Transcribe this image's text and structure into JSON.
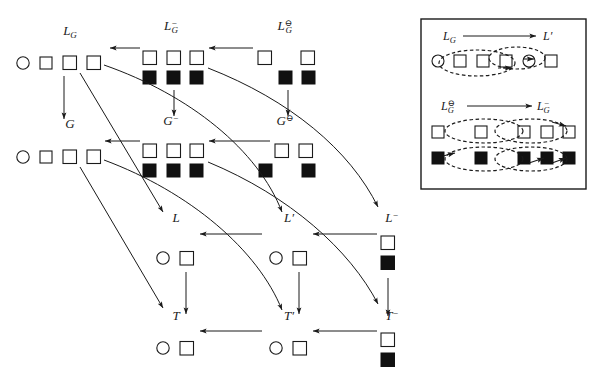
{
  "figure": {
    "type": "commutative-diagram",
    "colors": {
      "stroke": "#1a1a1a",
      "fill_open": "#ffffff",
      "fill_solid": "#111111",
      "background": "#ffffff"
    }
  },
  "main_diagram": {
    "objects": [
      {
        "id": "LG",
        "label": "L_G",
        "label_tex": "L_G",
        "glyphs_top": [
          "circle",
          "square",
          "square",
          "square"
        ],
        "glyphs_bottom": []
      },
      {
        "id": "LGminus",
        "label": "L_G^-",
        "label_tex": "L_G^{-}",
        "glyphs_top": [
          "square",
          "square",
          "square"
        ],
        "glyphs_bottom": [
          "solid",
          "solid",
          "solid"
        ]
      },
      {
        "id": "LGominus",
        "label": "L_G^⊖",
        "label_tex": "L_G^{\\ominus}",
        "glyphs_top": [
          "square",
          "square"
        ],
        "glyphs_bottom": [
          "solid",
          "solid"
        ]
      },
      {
        "id": "G",
        "label": "G",
        "label_tex": "G",
        "glyphs_top": [
          "circle",
          "square",
          "square",
          "square"
        ],
        "glyphs_bottom": []
      },
      {
        "id": "Gminus",
        "label": "G^-",
        "label_tex": "G^{-}",
        "glyphs_top": [
          "square",
          "square",
          "square"
        ],
        "glyphs_bottom": [
          "solid",
          "solid",
          "solid"
        ]
      },
      {
        "id": "Gominus",
        "label": "G^⊖",
        "label_tex": "G^{\\ominus}",
        "glyphs_top": [
          "square",
          "square"
        ],
        "glyphs_bottom": [
          "solid",
          "solid"
        ]
      },
      {
        "id": "L",
        "label": "L",
        "label_tex": "L",
        "glyphs_top": [
          "circle",
          "square"
        ],
        "glyphs_bottom": []
      },
      {
        "id": "Lprime",
        "label": "L'",
        "label_tex": "L'",
        "glyphs_top": [
          "circle",
          "square"
        ],
        "glyphs_bottom": []
      },
      {
        "id": "Lminus",
        "label": "L^-",
        "label_tex": "L^{-}",
        "glyphs_top": [
          "square"
        ],
        "glyphs_bottom": [
          "solid"
        ]
      },
      {
        "id": "T",
        "label": "T",
        "label_tex": "T",
        "glyphs_top": [
          "circle",
          "square"
        ],
        "glyphs_bottom": []
      },
      {
        "id": "Tprime",
        "label": "T'",
        "label_tex": "T'",
        "glyphs_top": [
          "circle",
          "square"
        ],
        "glyphs_bottom": []
      },
      {
        "id": "Tminus",
        "label": "T^-",
        "label_tex": "T^{-}",
        "glyphs_top": [
          "square"
        ],
        "glyphs_bottom": [
          "solid"
        ]
      }
    ],
    "arrows": [
      {
        "from": "LGminus",
        "to": "LG",
        "style": "straight-horizontal"
      },
      {
        "from": "LGominus",
        "to": "LGminus",
        "style": "straight-horizontal"
      },
      {
        "from": "Gminus",
        "to": "G",
        "style": "straight-horizontal"
      },
      {
        "from": "Gominus",
        "to": "Gminus",
        "style": "straight-horizontal"
      },
      {
        "from": "Lprime",
        "to": "L",
        "style": "straight-horizontal"
      },
      {
        "from": "Lminus",
        "to": "Lprime",
        "style": "straight-horizontal"
      },
      {
        "from": "Tprime",
        "to": "T",
        "style": "straight-horizontal"
      },
      {
        "from": "Tminus",
        "to": "Tprime",
        "style": "straight-horizontal"
      },
      {
        "from": "LG",
        "to": "G",
        "style": "straight-vertical"
      },
      {
        "from": "LGminus",
        "to": "Gminus",
        "style": "straight-vertical"
      },
      {
        "from": "LGominus",
        "to": "Gominus",
        "style": "straight-vertical"
      },
      {
        "from": "L",
        "to": "T",
        "style": "straight-vertical"
      },
      {
        "from": "Lprime",
        "to": "Tprime",
        "style": "straight-vertical"
      },
      {
        "from": "Lminus",
        "to": "Tminus",
        "style": "straight-vertical"
      },
      {
        "from": "LG",
        "to": "L",
        "style": "diagonal"
      },
      {
        "from": "LGminus",
        "to": "Lprime",
        "style": "curved"
      },
      {
        "from": "LGominus",
        "to": "Lminus",
        "style": "curved"
      },
      {
        "from": "G",
        "to": "T",
        "style": "diagonal"
      },
      {
        "from": "Gminus",
        "to": "Tprime",
        "style": "curved"
      },
      {
        "from": "Gominus",
        "to": "Tminus",
        "style": "curved"
      }
    ]
  },
  "inset": {
    "border": true,
    "mappings": [
      {
        "source_label": "L_G",
        "source_tex": "L_G",
        "target_label": "L'",
        "target_tex": "L'",
        "arrow": "→",
        "glyphs": [
          "circle",
          "square",
          "square",
          "square",
          "circle",
          "square"
        ],
        "ellipses": 2,
        "ellipse_style": "dashed"
      },
      {
        "source_label": "L_G^⊖",
        "source_tex": "L_G^{\\ominus}",
        "target_label": "L_G^-",
        "target_tex": "L_G^{-}",
        "arrow": "→",
        "glyphs_top": [
          "square",
          "square",
          "square",
          "square",
          "square"
        ],
        "glyphs_bottom": [
          "solid",
          "solid",
          "solid",
          "solid",
          "solid"
        ],
        "ellipses": 2,
        "ellipse_style": "dashed"
      }
    ]
  }
}
